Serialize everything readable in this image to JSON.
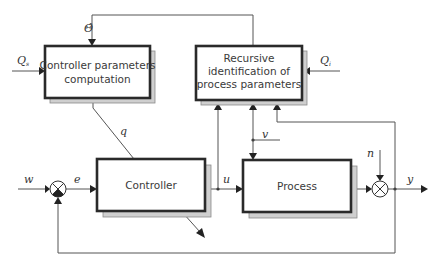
{
  "diagram": {
    "blocks": {
      "controller_params": {
        "line1": "Controller parameters",
        "line2": "computation"
      },
      "identification": {
        "line1": "Recursive",
        "line2": "identification of",
        "line3": "process parameters"
      },
      "controller": {
        "label": "Controller"
      },
      "process": {
        "label": "Process"
      }
    },
    "signals": {
      "theta_hat": "Θ̂",
      "q_s": {
        "main": "Q",
        "sub": "s"
      },
      "q_i": {
        "main": "Q",
        "sub": "i"
      },
      "q": "q",
      "w": "w",
      "e": "e",
      "u": "u",
      "v": "v",
      "n": "n",
      "y": "y"
    },
    "summing_junctions": [
      {
        "id": "error-junction",
        "negative_input": "bottom"
      },
      {
        "id": "noise-junction",
        "negative_input": "none"
      }
    ],
    "colors": {
      "box_border": "#2a2a2a",
      "shadow": "#cfcfcf",
      "wire": "#555555",
      "text": "#3a3a3a"
    }
  }
}
